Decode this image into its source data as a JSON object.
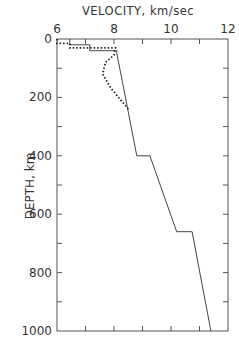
{
  "chart_data": {
    "type": "line",
    "title": "",
    "xlabel": "VELOCITY, km/sec",
    "ylabel": "DEPTH, km",
    "x_axis_position": "top",
    "xlim": [
      6,
      12
    ],
    "ylim": [
      1000,
      0
    ],
    "xticks": [
      6,
      8,
      10,
      12
    ],
    "yticks": [
      0,
      200,
      400,
      600,
      800,
      1000
    ],
    "grid": false,
    "legend": null,
    "series": [
      {
        "name": "solid-profile",
        "style": "solid",
        "points": [
          [
            6.45,
            0
          ],
          [
            6.45,
            20
          ],
          [
            7.15,
            20
          ],
          [
            7.15,
            40
          ],
          [
            8.1,
            40
          ],
          [
            8.1,
            50
          ],
          [
            8.3,
            150
          ],
          [
            8.8,
            400
          ],
          [
            9.26,
            400
          ],
          [
            10.2,
            660
          ],
          [
            10.74,
            660
          ],
          [
            11.4,
            1000
          ]
        ]
      },
      {
        "name": "dotted-profile",
        "style": "dotted",
        "points": [
          [
            6.0,
            0
          ],
          [
            6.0,
            15
          ],
          [
            6.45,
            15
          ],
          [
            6.45,
            30
          ],
          [
            8.05,
            30
          ],
          [
            8.0,
            55
          ],
          [
            7.7,
            80
          ],
          [
            7.6,
            120
          ],
          [
            7.9,
            170
          ],
          [
            8.5,
            240
          ]
        ]
      }
    ]
  },
  "labels": {
    "xlabel": "VELOCITY, km/sec",
    "ylabel": "DEPTH, km",
    "xtick_labels": [
      "6",
      "8",
      "10",
      "12"
    ],
    "ytick_labels": [
      "0",
      "200",
      "400",
      "600",
      "800",
      "1000"
    ]
  }
}
